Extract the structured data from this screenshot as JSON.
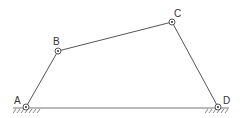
{
  "diagram": {
    "type": "four-bar linkage",
    "joints": [
      {
        "id": "A",
        "label": "A",
        "x": 26,
        "y": 107,
        "grounded": true
      },
      {
        "id": "B",
        "label": "B",
        "x": 58,
        "y": 51,
        "grounded": false
      },
      {
        "id": "C",
        "label": "C",
        "x": 172,
        "y": 22,
        "grounded": false
      },
      {
        "id": "D",
        "label": "D",
        "x": 218,
        "y": 107,
        "grounded": true
      }
    ],
    "links": [
      {
        "from": "A",
        "to": "B"
      },
      {
        "from": "B",
        "to": "C"
      },
      {
        "from": "C",
        "to": "D"
      },
      {
        "from": "A",
        "to": "D",
        "kind": "ground"
      }
    ]
  },
  "labels": {
    "A": "A",
    "B": "B",
    "C": "C",
    "D": "D"
  }
}
